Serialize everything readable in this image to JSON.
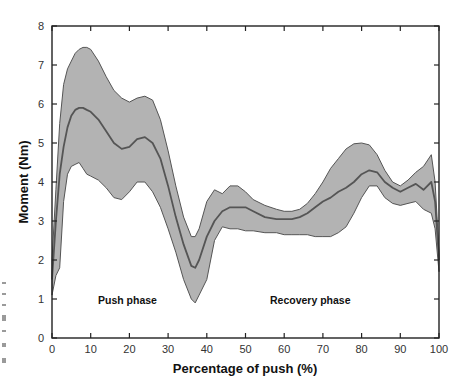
{
  "chart_data": {
    "type": "area",
    "title": "",
    "xlabel": "Percentage of push (%)",
    "ylabel": "Moment (Nm)",
    "xlim": [
      0,
      100
    ],
    "ylim": [
      0,
      8
    ],
    "xticks": [
      0,
      10,
      20,
      30,
      40,
      50,
      60,
      70,
      80,
      90,
      100
    ],
    "yticks": [
      0,
      1,
      2,
      3,
      4,
      5,
      6,
      7,
      8
    ],
    "grid": false,
    "legend": null,
    "annotations": [
      {
        "text": "Push phase",
        "x": 20,
        "y": 1.1
      },
      {
        "text": "Recovery phase",
        "x": 69,
        "y": 1.1
      }
    ],
    "x": [
      0,
      1,
      2,
      3,
      4,
      5,
      6,
      7,
      8,
      9,
      10,
      12,
      14,
      16,
      18,
      20,
      22,
      24,
      26,
      28,
      30,
      32,
      34,
      36,
      37,
      38,
      40,
      42,
      44,
      46,
      48,
      50,
      52,
      55,
      58,
      60,
      62,
      64,
      66,
      68,
      70,
      72,
      74,
      76,
      78,
      80,
      82,
      84,
      86,
      88,
      90,
      92,
      94,
      96,
      98,
      99,
      100
    ],
    "series": [
      {
        "name": "Mean",
        "role": "line",
        "values": [
          1.5,
          3.0,
          4.2,
          4.9,
          5.4,
          5.7,
          5.85,
          5.9,
          5.9,
          5.85,
          5.8,
          5.6,
          5.3,
          5.0,
          4.85,
          4.9,
          5.1,
          5.15,
          5.0,
          4.6,
          3.9,
          3.1,
          2.4,
          1.85,
          1.8,
          2.0,
          2.6,
          3.0,
          3.25,
          3.35,
          3.35,
          3.35,
          3.25,
          3.1,
          3.05,
          3.05,
          3.05,
          3.1,
          3.2,
          3.35,
          3.5,
          3.6,
          3.75,
          3.85,
          4.0,
          4.2,
          4.3,
          4.25,
          4.0,
          3.85,
          3.75,
          3.85,
          3.95,
          3.8,
          4.0,
          3.5,
          2.0
        ]
      },
      {
        "name": "Upper bound (+SD)",
        "role": "band-upper",
        "values": [
          2.0,
          3.8,
          5.5,
          6.5,
          6.9,
          7.1,
          7.3,
          7.4,
          7.45,
          7.45,
          7.4,
          7.1,
          6.7,
          6.35,
          6.15,
          6.05,
          6.15,
          6.2,
          6.1,
          5.6,
          4.8,
          3.9,
          3.1,
          2.6,
          2.6,
          2.8,
          3.5,
          3.8,
          3.7,
          3.9,
          3.9,
          3.75,
          3.55,
          3.4,
          3.3,
          3.25,
          3.25,
          3.3,
          3.45,
          3.7,
          4.0,
          4.35,
          4.6,
          4.85,
          4.98,
          5.0,
          4.95,
          4.7,
          4.3,
          4.0,
          3.9,
          4.05,
          4.25,
          4.4,
          4.7,
          4.0,
          2.2
        ]
      },
      {
        "name": "Lower bound (-SD)",
        "role": "band-lower",
        "values": [
          1.1,
          1.6,
          1.8,
          3.5,
          4.2,
          4.4,
          4.45,
          4.5,
          4.35,
          4.2,
          4.15,
          4.05,
          3.85,
          3.6,
          3.55,
          3.75,
          4.0,
          4.0,
          3.75,
          3.35,
          2.8,
          2.2,
          1.5,
          1.0,
          0.9,
          1.1,
          1.5,
          2.5,
          2.85,
          2.8,
          2.8,
          2.75,
          2.75,
          2.7,
          2.7,
          2.65,
          2.65,
          2.65,
          2.65,
          2.6,
          2.6,
          2.6,
          2.7,
          2.85,
          3.2,
          3.6,
          3.9,
          3.9,
          3.6,
          3.45,
          3.4,
          3.45,
          3.5,
          3.3,
          3.2,
          2.8,
          1.7
        ]
      }
    ],
    "colors": {
      "band_fill": "#b3b3b3",
      "band_edge": "#555555",
      "mean_line": "#555555",
      "axis": "#222222"
    }
  }
}
